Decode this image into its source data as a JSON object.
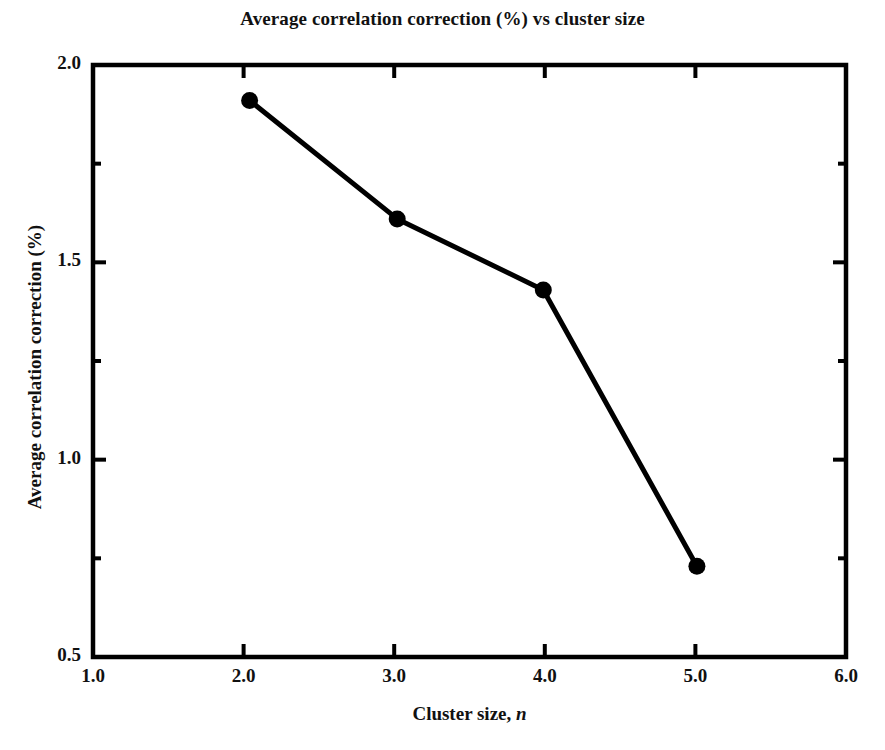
{
  "chart_data": {
    "type": "line",
    "title": "Average correlation correction (%) vs cluster size",
    "xlabel_prefix": "Cluster size, ",
    "xlabel_symbol": "n",
    "ylabel": "Average correlation correction (%)",
    "xlim": [
      1.0,
      6.0
    ],
    "ylim": [
      0.5,
      2.0
    ],
    "xticks": [
      1.0,
      2.0,
      3.0,
      4.0,
      5.0,
      6.0
    ],
    "xtick_labels": [
      "1.0",
      "2.0",
      "3.0",
      "4.0",
      "5.0",
      "6.0"
    ],
    "yticks": [
      0.5,
      1.0,
      1.5,
      2.0
    ],
    "ytick_labels": [
      "0.5",
      "1.0",
      "1.5",
      "2.0"
    ],
    "y_minor_ticks": [
      0.75,
      1.25,
      1.75
    ],
    "x_minor_ticks": [],
    "grid": false,
    "legend": null,
    "series": [
      {
        "name": "Average correlation correction",
        "marker": "filled-circle",
        "marker_color": "#000000",
        "line_color": "#000000",
        "x": [
          2.04,
          3.02,
          3.99,
          5.01
        ],
        "y": [
          1.91,
          1.61,
          1.43,
          0.73
        ]
      }
    ]
  },
  "colors": {
    "background": "#ffffff",
    "axis": "#000000",
    "data": "#000000"
  }
}
